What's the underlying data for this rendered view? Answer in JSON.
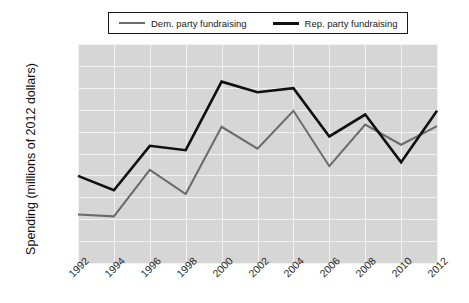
{
  "chart_data": {
    "type": "line",
    "title": "",
    "xlabel": "",
    "ylabel": "Spending (millions of 2012 dollars)",
    "categories": [
      "1992",
      "1994",
      "1996",
      "1998",
      "2000",
      "2002",
      "2004",
      "2006",
      "2008",
      "2010",
      "2012"
    ],
    "x": [
      1992,
      1994,
      1996,
      1998,
      2000,
      2002,
      2004,
      2006,
      2008,
      2010,
      2012
    ],
    "series": [
      {
        "name": "Dem. party fundraising",
        "color": "#6b6b6b",
        "values": [
          222,
          213,
          425,
          315,
          622,
          522,
          695,
          442,
          632,
          540,
          625
        ]
      },
      {
        "name": "Rep. party fundraising",
        "color": "#101010",
        "values": [
          398,
          332,
          535,
          515,
          828,
          780,
          798,
          578,
          678,
          460,
          695
        ]
      }
    ],
    "ylim": [
      0,
      1000
    ],
    "yticks": [
      0,
      100,
      200,
      300,
      400,
      500,
      600,
      700,
      800,
      900,
      1000
    ],
    "ytick_labels": [
      "0",
      "100",
      "200",
      "300",
      "400",
      "500",
      "600",
      "700",
      "800",
      "900",
      "1000"
    ],
    "grid": true,
    "legend_position": "top",
    "plot_background": "#d6d6d6",
    "grid_color": "#f2f2f2"
  },
  "legend": {
    "entries": [
      {
        "label": "Dem. party fundraising",
        "swatch": "dem-line-swatch"
      },
      {
        "label": "Rep. party fundraising",
        "swatch": "rep-line-swatch"
      }
    ]
  },
  "axes": {
    "y_title": "Spending (millions of 2012 dollars)"
  }
}
